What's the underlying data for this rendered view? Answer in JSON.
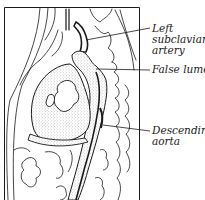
{
  "figure": {
    "labels": [
      {
        "id": "left-subclavian-artery",
        "lines": [
          "Left",
          "subclavian",
          "artery"
        ]
      },
      {
        "id": "false-lumen",
        "lines": [
          "False lumen"
        ]
      },
      {
        "id": "descending-aorta",
        "lines": [
          "Descending",
          "aorta"
        ]
      }
    ]
  },
  "colors": {
    "ink": "#1a1a1a",
    "background": "#ffffff",
    "stipple": "#555555"
  }
}
